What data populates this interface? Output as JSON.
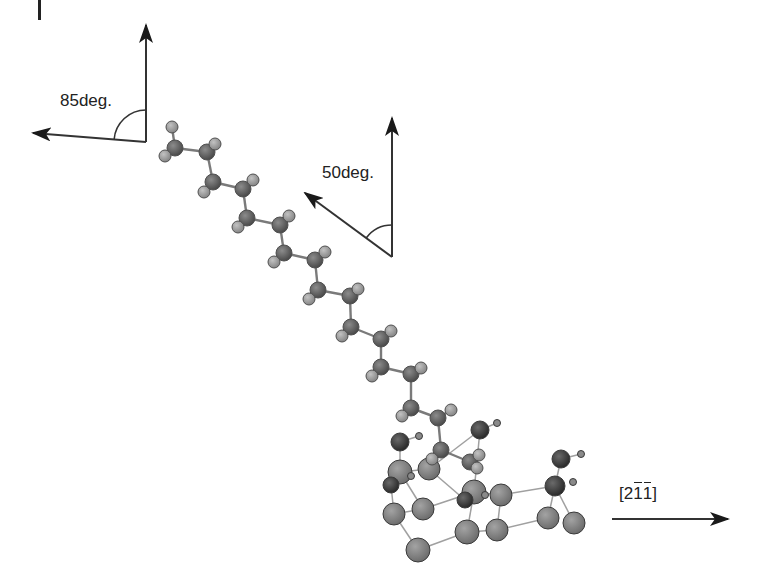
{
  "diagram": {
    "type": "molecular-structure",
    "labels": {
      "angle_top_left": "85deg.",
      "angle_middle": "50deg.",
      "direction": {
        "open": "[",
        "d1": "2",
        "d2": "1",
        "d3": "1",
        "close": "]",
        "overbars": [
          "d2",
          "d3"
        ]
      }
    },
    "angle_markers": [
      {
        "name": "85deg",
        "vertex": [
          146,
          142
        ],
        "up_tip": [
          146,
          25
        ],
        "left_tip": [
          33,
          133
        ],
        "arc_radius": 32,
        "label_pos": [
          60,
          90
        ]
      },
      {
        "name": "50deg",
        "vertex": [
          392,
          257
        ],
        "up_tip": [
          392,
          118
        ],
        "left_tip": [
          305,
          193
        ],
        "arc_radius": 32,
        "label_pos": [
          322,
          163
        ]
      }
    ],
    "direction_arrow": {
      "from": [
        612,
        519
      ],
      "to": [
        728,
        519
      ],
      "label_pos": [
        619,
        484
      ]
    },
    "colors": {
      "carbon": "#5f5f5f",
      "hydrogen": "#9a9a9a",
      "surface_large": "#808080",
      "surface_dark": "#3a3a3a",
      "small_h": "#8a8a8a",
      "bond": "#8a8a8a",
      "arrow": "#222222",
      "text": "#222222"
    },
    "chain_atoms": [
      {
        "t": "H",
        "x": 172,
        "y": 127,
        "r": 6
      },
      {
        "t": "C",
        "x": 175,
        "y": 148,
        "r": 8
      },
      {
        "t": "H",
        "x": 165,
        "y": 156,
        "r": 6
      },
      {
        "t": "C",
        "x": 207,
        "y": 152,
        "r": 8
      },
      {
        "t": "H",
        "x": 215,
        "y": 144,
        "r": 6
      },
      {
        "t": "C",
        "x": 213,
        "y": 182,
        "r": 8
      },
      {
        "t": "H",
        "x": 204,
        "y": 192,
        "r": 6
      },
      {
        "t": "C",
        "x": 243,
        "y": 189,
        "r": 8
      },
      {
        "t": "H",
        "x": 253,
        "y": 180,
        "r": 6
      },
      {
        "t": "C",
        "x": 247,
        "y": 218,
        "r": 8
      },
      {
        "t": "H",
        "x": 238,
        "y": 227,
        "r": 6
      },
      {
        "t": "C",
        "x": 280,
        "y": 225,
        "r": 8
      },
      {
        "t": "H",
        "x": 289,
        "y": 216,
        "r": 6
      },
      {
        "t": "C",
        "x": 284,
        "y": 253,
        "r": 8
      },
      {
        "t": "H",
        "x": 274,
        "y": 262,
        "r": 6
      },
      {
        "t": "C",
        "x": 315,
        "y": 260,
        "r": 8
      },
      {
        "t": "H",
        "x": 325,
        "y": 252,
        "r": 6
      },
      {
        "t": "C",
        "x": 318,
        "y": 290,
        "r": 8
      },
      {
        "t": "H",
        "x": 309,
        "y": 299,
        "r": 6
      },
      {
        "t": "C",
        "x": 350,
        "y": 296,
        "r": 8
      },
      {
        "t": "H",
        "x": 358,
        "y": 289,
        "r": 6
      },
      {
        "t": "C",
        "x": 351,
        "y": 327,
        "r": 8
      },
      {
        "t": "H",
        "x": 342,
        "y": 336,
        "r": 6
      },
      {
        "t": "C",
        "x": 381,
        "y": 339,
        "r": 8
      },
      {
        "t": "H",
        "x": 391,
        "y": 331,
        "r": 6
      },
      {
        "t": "C",
        "x": 381,
        "y": 367,
        "r": 8
      },
      {
        "t": "H",
        "x": 372,
        "y": 376,
        "r": 6
      },
      {
        "t": "C",
        "x": 411,
        "y": 374,
        "r": 8
      },
      {
        "t": "H",
        "x": 421,
        "y": 368,
        "r": 6
      },
      {
        "t": "C",
        "x": 411,
        "y": 408,
        "r": 8
      },
      {
        "t": "H",
        "x": 402,
        "y": 416,
        "r": 6
      },
      {
        "t": "C",
        "x": 438,
        "y": 418,
        "r": 8
      },
      {
        "t": "H",
        "x": 451,
        "y": 410,
        "r": 6
      },
      {
        "t": "C",
        "x": 441,
        "y": 450,
        "r": 8
      },
      {
        "t": "H",
        "x": 432,
        "y": 459,
        "r": 6
      },
      {
        "t": "C",
        "x": 470,
        "y": 462,
        "r": 8
      },
      {
        "t": "H",
        "x": 479,
        "y": 455,
        "r": 6
      },
      {
        "t": "H",
        "x": 477,
        "y": 468,
        "r": 6
      }
    ],
    "chain_bonds": [
      [
        0,
        1
      ],
      [
        1,
        2
      ],
      [
        1,
        3
      ],
      [
        3,
        4
      ],
      [
        3,
        5
      ],
      [
        5,
        6
      ],
      [
        5,
        7
      ],
      [
        7,
        8
      ],
      [
        7,
        9
      ],
      [
        9,
        10
      ],
      [
        9,
        11
      ],
      [
        11,
        12
      ],
      [
        11,
        13
      ],
      [
        13,
        14
      ],
      [
        13,
        15
      ],
      [
        15,
        16
      ],
      [
        15,
        17
      ],
      [
        17,
        18
      ],
      [
        17,
        19
      ],
      [
        19,
        20
      ],
      [
        19,
        21
      ],
      [
        21,
        22
      ],
      [
        21,
        23
      ],
      [
        23,
        24
      ],
      [
        23,
        25
      ],
      [
        25,
        26
      ],
      [
        25,
        27
      ],
      [
        27,
        28
      ],
      [
        27,
        29
      ],
      [
        29,
        30
      ],
      [
        29,
        31
      ],
      [
        31,
        32
      ],
      [
        31,
        33
      ],
      [
        33,
        34
      ],
      [
        33,
        35
      ],
      [
        35,
        36
      ],
      [
        35,
        37
      ]
    ],
    "surface_atoms": [
      {
        "t": "D",
        "x": 400,
        "y": 442,
        "r": 9
      },
      {
        "t": "s",
        "x": 419,
        "y": 436,
        "r": 3.5
      },
      {
        "t": "D",
        "x": 480,
        "y": 430,
        "r": 9
      },
      {
        "t": "s",
        "x": 497,
        "y": 423,
        "r": 3.5
      },
      {
        "t": "D",
        "x": 561,
        "y": 459,
        "r": 9
      },
      {
        "t": "s",
        "x": 581,
        "y": 454,
        "r": 3.5
      },
      {
        "t": "L",
        "x": 400,
        "y": 472,
        "r": 12
      },
      {
        "t": "D",
        "x": 391,
        "y": 485,
        "r": 8
      },
      {
        "t": "s",
        "x": 411,
        "y": 476,
        "r": 3.5
      },
      {
        "t": "L",
        "x": 429,
        "y": 469,
        "r": 11
      },
      {
        "t": "L",
        "x": 474,
        "y": 492,
        "r": 12
      },
      {
        "t": "D",
        "x": 465,
        "y": 500,
        "r": 8
      },
      {
        "t": "s",
        "x": 485,
        "y": 495,
        "r": 3.5
      },
      {
        "t": "L",
        "x": 501,
        "y": 495,
        "r": 11
      },
      {
        "t": "D",
        "x": 555,
        "y": 486,
        "r": 10
      },
      {
        "t": "s",
        "x": 573,
        "y": 482,
        "r": 3.5
      },
      {
        "t": "L",
        "x": 394,
        "y": 514,
        "r": 11
      },
      {
        "t": "L",
        "x": 423,
        "y": 509,
        "r": 11
      },
      {
        "t": "L",
        "x": 467,
        "y": 532,
        "r": 12
      },
      {
        "t": "L",
        "x": 497,
        "y": 530,
        "r": 11
      },
      {
        "t": "L",
        "x": 548,
        "y": 518,
        "r": 11
      },
      {
        "t": "L",
        "x": 574,
        "y": 523,
        "r": 11
      },
      {
        "t": "L",
        "x": 418,
        "y": 550,
        "r": 12
      }
    ],
    "surface_bonds": [
      [
        0,
        1
      ],
      [
        2,
        3
      ],
      [
        4,
        5
      ],
      [
        0,
        6
      ],
      [
        6,
        7
      ],
      [
        6,
        9
      ],
      [
        7,
        16
      ],
      [
        6,
        17
      ],
      [
        16,
        22
      ],
      [
        16,
        17
      ],
      [
        17,
        10
      ],
      [
        10,
        18
      ],
      [
        10,
        13
      ],
      [
        13,
        19
      ],
      [
        18,
        19
      ],
      [
        19,
        20
      ],
      [
        20,
        14
      ],
      [
        14,
        21
      ],
      [
        14,
        4
      ],
      [
        13,
        14
      ],
      [
        22,
        18
      ],
      [
        9,
        2
      ],
      [
        10,
        2
      ],
      [
        9,
        11
      ]
    ]
  }
}
